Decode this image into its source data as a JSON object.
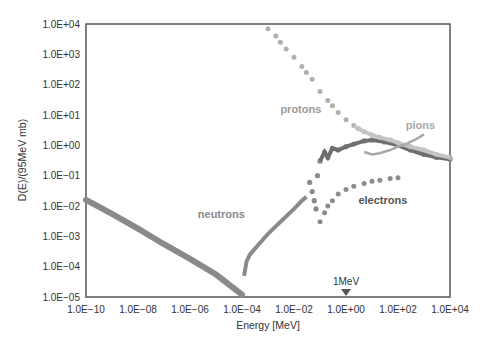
{
  "chart_data": {
    "type": "scatter",
    "title": "",
    "xlabel": "Energy [MeV]",
    "ylabel": "D(E)/(95MeV mb)",
    "xscale": "log",
    "yscale": "log",
    "xlim": [
      1e-10,
      10000.0
    ],
    "ylim": [
      1e-05,
      10000.0
    ],
    "x_ticks": [
      "1.0E−10",
      "1.0E−08",
      "1.0E−06",
      "1.0E−04",
      "1.0E−02",
      "1.0E+00",
      "1.0E+02",
      "1.0E+04"
    ],
    "y_ticks": [
      "1.0E+04",
      "1.0E+03",
      "1.0E+02",
      "1.0E+01",
      "1.0E+00",
      "1.0E−01",
      "1.0E−02",
      "1.0E−03",
      "1.0E−04",
      "1.0E−05"
    ],
    "grid": false,
    "annotation": {
      "text": "1MeV",
      "x": 1.0,
      "marker": "down-triangle"
    },
    "series": [
      {
        "name": "neutrons",
        "color": "#8a8a8a",
        "points": [
          [
            1e-10,
            0.016
          ],
          [
            1e-09,
            0.0055
          ],
          [
            1e-08,
            0.0018
          ],
          [
            1e-07,
            0.00055
          ],
          [
            1e-06,
            0.00018
          ],
          [
            1e-05,
            5.5e-05
          ],
          [
            0.0001,
            1.2e-05
          ],
          [
            0.00012,
            5e-05
          ],
          [
            0.00015,
            0.00015
          ],
          [
            0.0002,
            0.00025
          ],
          [
            0.0004,
            0.0005
          ],
          [
            0.001,
            0.0012
          ],
          [
            0.003,
            0.003
          ],
          [
            0.01,
            0.008
          ],
          [
            0.02,
            0.015
          ],
          [
            0.03,
            0.02
          ],
          [
            0.04,
            0.06
          ],
          [
            0.05,
            0.03
          ],
          [
            0.06,
            0.015
          ],
          [
            0.07,
            0.008
          ],
          [
            0.08,
            0.1
          ],
          [
            0.1,
            0.3
          ],
          [
            0.15,
            0.6
          ],
          [
            0.2,
            0.4
          ],
          [
            0.3,
            0.8
          ],
          [
            0.5,
            0.7
          ],
          [
            1,
            0.9
          ],
          [
            2,
            1.1
          ],
          [
            5,
            1.4
          ],
          [
            10,
            1.5
          ],
          [
            30,
            1.3
          ],
          [
            100,
            1.0
          ],
          [
            300,
            0.7
          ],
          [
            1000,
            0.5
          ],
          [
            3000,
            0.4
          ],
          [
            10000,
            0.35
          ]
        ]
      },
      {
        "name": "protons",
        "color": "#b0b0b0",
        "points": [
          [
            0.001,
            7000.0
          ],
          [
            0.002,
            4000.0
          ],
          [
            0.003,
            2500.0
          ],
          [
            0.005,
            1500.0
          ],
          [
            0.01,
            800.0
          ],
          [
            0.02,
            400.0
          ],
          [
            0.03,
            250.0
          ],
          [
            0.05,
            150.0
          ],
          [
            0.1,
            60.0
          ],
          [
            0.2,
            30.0
          ],
          [
            0.3,
            20.0
          ],
          [
            0.5,
            12.0
          ],
          [
            1,
            7
          ],
          [
            2,
            4.5
          ],
          [
            3,
            3.5
          ],
          [
            5,
            2.8
          ],
          [
            10,
            2.2
          ],
          [
            20,
            1.8
          ],
          [
            50,
            1.5
          ],
          [
            100,
            1.2
          ],
          [
            300,
            0.9
          ],
          [
            1000,
            0.7
          ],
          [
            3000,
            0.5
          ],
          [
            10000,
            0.4
          ]
        ]
      },
      {
        "name": "pions",
        "color": "#a8a8a8",
        "points": [
          [
            5,
            0.6
          ],
          [
            10,
            0.5
          ],
          [
            20,
            0.55
          ],
          [
            50,
            0.7
          ],
          [
            100,
            0.9
          ],
          [
            200,
            1.1
          ],
          [
            500,
            1.6
          ],
          [
            1000,
            2.3
          ]
        ]
      },
      {
        "name": "electrons",
        "color": "#8c8c8c",
        "points": [
          [
            0.1,
            0.003
          ],
          [
            0.15,
            0.006
          ],
          [
            0.2,
            0.01
          ],
          [
            0.3,
            0.015
          ],
          [
            0.5,
            0.025
          ],
          [
            1,
            0.035
          ],
          [
            2,
            0.045
          ],
          [
            5,
            0.055
          ],
          [
            10,
            0.065
          ],
          [
            20,
            0.07
          ],
          [
            50,
            0.08
          ],
          [
            100,
            0.085
          ]
        ]
      }
    ],
    "labels": [
      {
        "text": "protons",
        "x": 0.003,
        "y": 12
      },
      {
        "text": "pions",
        "x": 200,
        "y": 3.5
      },
      {
        "text": "neutrons",
        "x": 2e-06,
        "y": 0.004
      },
      {
        "text": "electrons",
        "x": 3,
        "y": 0.012
      }
    ]
  }
}
